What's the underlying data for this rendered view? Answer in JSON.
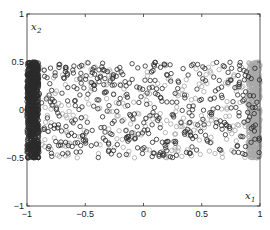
{
  "chart_data": {
    "type": "scatter",
    "title": "",
    "xlabel": "x1",
    "ylabel": "x2",
    "xlabel_main": "x",
    "xlabel_sub": "1",
    "ylabel_main": "x",
    "ylabel_sub": "2",
    "xlim": [
      -1,
      1
    ],
    "ylim": [
      -1,
      1
    ],
    "xticks": [
      -1,
      -0.5,
      0,
      0.5,
      1
    ],
    "yticks": [
      -1,
      -0.5,
      0,
      0.5,
      1
    ],
    "xtick_labels": [
      "−1",
      "−0.5",
      "0",
      "0.5",
      "1"
    ],
    "ytick_labels": [
      "−1",
      "−0.5",
      "0",
      "0.5",
      "1"
    ],
    "grid": false,
    "legend": null,
    "marker": "open-circle",
    "series": [
      {
        "name": "dark",
        "color": "#2b2b2b",
        "description": "Dark open circles, uniformly scattered over x1 in [-1,1], x2 in [-0.5,0.5]; extremely dense band for x1 in [-1,-0.9]",
        "regions": [
          {
            "x_range": [
              -1.0,
              -0.9
            ],
            "y_range": [
              -0.5,
              0.5
            ],
            "count": 700
          },
          {
            "x_range": [
              -0.9,
              1.0
            ],
            "y_range": [
              -0.5,
              0.5
            ],
            "count": 420
          }
        ]
      },
      {
        "name": "light",
        "color": "#a8a8a8",
        "description": "Light gray open circles, uniformly scattered over x1 in [-1,1], x2 in [-0.5,0.5]; dense band for x1 in [0.9,1]",
        "regions": [
          {
            "x_range": [
              0.9,
              1.0
            ],
            "y_range": [
              -0.5,
              0.5
            ],
            "count": 500
          },
          {
            "x_range": [
              -1.0,
              0.9
            ],
            "y_range": [
              -0.5,
              0.5
            ],
            "count": 260
          }
        ]
      }
    ],
    "axes_box_px": {
      "left": 27,
      "top": 14,
      "right": 260,
      "bottom": 206
    }
  }
}
